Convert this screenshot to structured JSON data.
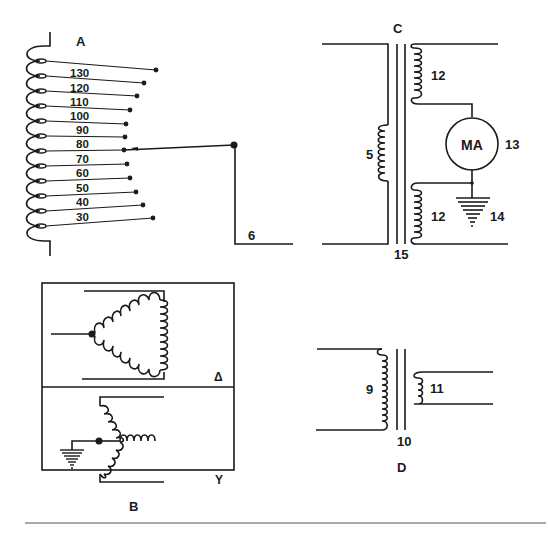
{
  "panels": {
    "a": {
      "label": "A",
      "taps": [
        "130",
        "120",
        "110",
        "100",
        "90",
        "80",
        "70",
        "60",
        "50",
        "40",
        "30"
      ],
      "selected_tap": "80",
      "output_label": "6"
    },
    "b": {
      "label": "B",
      "delta_label": "Δ",
      "wye_label": "Y"
    },
    "c": {
      "label": "C",
      "primary_label": "5",
      "secondary_upper_label": "12",
      "secondary_lower_label": "12",
      "meter_text": "MA",
      "meter_label": "13",
      "ground_label": "14",
      "core_label": "15"
    },
    "d": {
      "label": "D",
      "primary_label": "9",
      "core_label": "10",
      "secondary_label": "11"
    }
  },
  "colors": {
    "ink": "#1a1a1a",
    "background": "#ffffff",
    "rule": "#555555"
  }
}
